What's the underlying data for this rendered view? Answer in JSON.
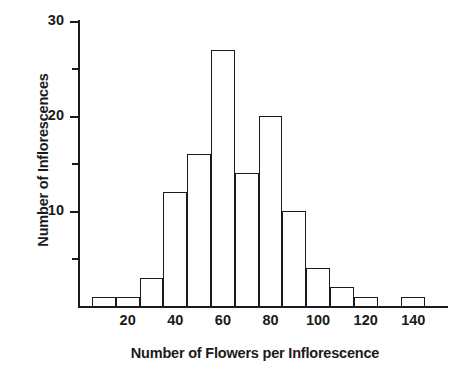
{
  "chart_data": {
    "type": "bar",
    "title": "",
    "subtitle": "",
    "xlabel": "Number of Flowers per Inflorescence",
    "ylabel": "Number of Inflorescences",
    "grid": false,
    "legend": null,
    "xlim": [
      0,
      150
    ],
    "ylim": [
      0,
      30
    ],
    "bin_width": 10,
    "bin_edges": [
      5,
      15,
      25,
      35,
      45,
      55,
      65,
      75,
      85,
      95,
      105,
      115,
      125,
      135,
      145
    ],
    "categories": [
      "5-15",
      "15-25",
      "25-35",
      "35-45",
      "45-55",
      "55-65",
      "65-75",
      "75-85",
      "85-95",
      "95-105",
      "105-115",
      "115-125",
      "125-135",
      "135-145"
    ],
    "bin_centers": [
      10,
      20,
      30,
      40,
      50,
      60,
      70,
      80,
      90,
      100,
      110,
      120,
      130,
      140
    ],
    "values": [
      1,
      1,
      3,
      12,
      16,
      27,
      14,
      20,
      10,
      4,
      2,
      1,
      0,
      1
    ],
    "xticks": [
      20,
      40,
      60,
      80,
      100,
      120,
      140
    ],
    "xtick_labels": [
      "20",
      "40",
      "60",
      "80",
      "100",
      "120",
      "140"
    ],
    "yticks": [
      5,
      10,
      15,
      20,
      25,
      30
    ],
    "ytick_major": [
      10,
      20,
      30
    ],
    "ytick_minor": [
      5,
      15,
      25
    ],
    "ytick_labels": [
      "10",
      "20",
      "30"
    ],
    "bar_fill_color": "#ffffff",
    "bar_edge_color": "#1a1a1a",
    "axis_color": "#1a1a1a",
    "background_color": "#ffffff"
  }
}
